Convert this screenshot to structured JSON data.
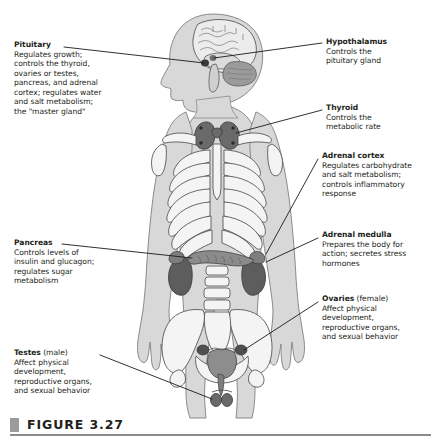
{
  "figure": {
    "caption_label": "FIGURE 3.27",
    "marker_color": "#9b9b9b",
    "rule_color": "#8c8c8c",
    "text_color": "#231f20"
  },
  "callouts": {
    "pituitary": {
      "title": "Pituitary",
      "title_suffix": "",
      "lines": [
        "Regulates growth;",
        "controls the thyroid,",
        "ovaries or testes,",
        "pancreas, and adrenal",
        "cortex; regulates water",
        "and salt metabolism;",
        "the \"master gland\""
      ],
      "side": "left"
    },
    "pancreas": {
      "title": "Pancreas",
      "title_suffix": "",
      "lines": [
        "Controls levels of",
        "insulin and glucagon;",
        "regulates sugar",
        "metabolism"
      ],
      "side": "left"
    },
    "testes": {
      "title": "Testes",
      "title_suffix": " (male)",
      "lines": [
        "Affect physical",
        "development,",
        "reproductive organs,",
        "and sexual behavior"
      ],
      "side": "left"
    },
    "hypothalamus": {
      "title": "Hypothalamus",
      "title_suffix": "",
      "lines": [
        "Controls the",
        "pituitary gland"
      ],
      "side": "right"
    },
    "thyroid": {
      "title": "Thyroid",
      "title_suffix": "",
      "lines": [
        "Controls the",
        "metabolic rate"
      ],
      "side": "right"
    },
    "adrenal_cortex": {
      "title": "Adrenal cortex",
      "title_suffix": "",
      "lines": [
        "Regulates carbohydrate",
        "and salt metabolism;",
        "controls inflammatory",
        "response"
      ],
      "side": "right"
    },
    "adrenal_medulla": {
      "title": "Adrenal medulla",
      "title_suffix": "",
      "lines": [
        "Prepares the body for",
        "action; secretes stress",
        "hormones"
      ],
      "side": "right"
    },
    "ovaries": {
      "title": "Ovaries",
      "title_suffix": " (female)",
      "lines": [
        "Affect physical",
        "development,",
        "reproductive organs,",
        "and sexual behavior"
      ],
      "side": "right"
    }
  },
  "illustration": {
    "body_fill": "#d8d8d8",
    "body_stroke": "#6e6e6e",
    "bone_fill": "#f2f2f2",
    "bone_stroke": "#4d4d4d",
    "organ_dark": "#5f5f5f",
    "organ_mid": "#9a9a9a",
    "brain_fill": "#e8e8e8",
    "leader_color": "#1a1a1a"
  }
}
